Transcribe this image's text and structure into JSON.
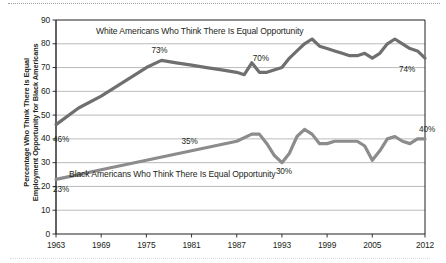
{
  "chart_data": {
    "type": "line",
    "title": "",
    "xlabel": "",
    "ylabel_line1": "Percentage Who Think There Is Equal",
    "ylabel_line2": "Employment Opportunity for Black Americans",
    "xlim": [
      1963,
      2012
    ],
    "ylim": [
      0,
      90
    ],
    "ytick_labels": [
      "0",
      "10",
      "20",
      "30",
      "40",
      "50",
      "60",
      "70",
      "80",
      "90"
    ],
    "ytick_values": [
      0,
      10,
      20,
      30,
      40,
      50,
      60,
      70,
      80,
      90
    ],
    "xtick_labels": [
      "1963",
      "1969",
      "1975",
      "1981",
      "1987",
      "1993",
      "1999",
      "2005",
      "2012"
    ],
    "xtick_values": [
      1963,
      1969,
      1975,
      1981,
      1987,
      1993,
      1999,
      2005,
      2012
    ],
    "grid": "horizontal",
    "legend_position": "inline-annotations",
    "series": [
      {
        "name": "White Americans Who Think There Is Equal Opportunity",
        "color": "#6f6f6f",
        "annotation_label": "White Americans Who Think There Is Equal Opportunity",
        "x": [
          1963,
          1966,
          1969,
          1972,
          1975,
          1977,
          1979,
          1981,
          1983,
          1985,
          1987,
          1988,
          1989,
          1990,
          1991,
          1993,
          1994,
          1995,
          1996,
          1997,
          1998,
          1999,
          2000,
          2001,
          2002,
          2003,
          2004,
          2005,
          2006,
          2007,
          2008,
          2009,
          2010,
          2011,
          2012
        ],
        "values": [
          46,
          53,
          58,
          64,
          70,
          73,
          72,
          71,
          70,
          69,
          68,
          67,
          72,
          68,
          68,
          70,
          74,
          77,
          80,
          82,
          79,
          78,
          77,
          76,
          75,
          75,
          76,
          74,
          76,
          80,
          82,
          80,
          78,
          77,
          74
        ],
        "point_labels": [
          {
            "x": 1963,
            "value": 46,
            "text": "46%"
          },
          {
            "x": 1977,
            "value": 73,
            "text": "73%"
          },
          {
            "x": 1991,
            "value": 70,
            "text": "70%"
          },
          {
            "x": 2012,
            "value": 74,
            "text": "74%"
          }
        ]
      },
      {
        "name": "Black Americans Who Think There Is Equal Opportunity",
        "color": "#8c8c8c",
        "annotation_label": "Black Americans Who Think There Is Equal Opportunity",
        "x": [
          1963,
          1966,
          1969,
          1972,
          1975,
          1978,
          1981,
          1984,
          1987,
          1989,
          1990,
          1991,
          1992,
          1993,
          1994,
          1995,
          1996,
          1997,
          1998,
          1999,
          2000,
          2001,
          2002,
          2003,
          2004,
          2005,
          2006,
          2007,
          2008,
          2009,
          2010,
          2011,
          2012
        ],
        "values": [
          23,
          25,
          27,
          29,
          31,
          33,
          35,
          37,
          39,
          42,
          42,
          38,
          33,
          30,
          34,
          41,
          44,
          42,
          38,
          38,
          39,
          39,
          39,
          39,
          37,
          31,
          35,
          40,
          41,
          39,
          38,
          40,
          40
        ],
        "point_labels": [
          {
            "x": 1963,
            "value": 23,
            "text": "23%"
          },
          {
            "x": 1981,
            "value": 35,
            "text": "35%"
          },
          {
            "x": 1993,
            "value": 30,
            "text": "30%"
          },
          {
            "x": 2012,
            "value": 40,
            "text": "40%"
          }
        ]
      }
    ],
    "annotations": [
      {
        "text": "White Americans Who Think There Is Equal Opportunity",
        "x_px": 96,
        "y_px": 31
      },
      {
        "text": "Black Americans Who Think There Is Equal Opportunity",
        "x_px": 69,
        "y_px": 174
      }
    ]
  }
}
